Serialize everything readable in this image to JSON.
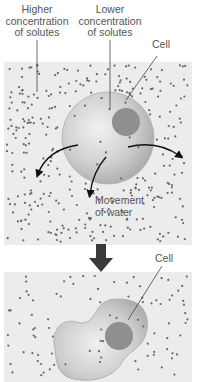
{
  "labels": {
    "higher_line1": "Higher",
    "higher_line2": "concentration",
    "higher_line3": "of solutes",
    "lower_line1": "Lower",
    "lower_line2": "concentration",
    "lower_line3": "of solutes",
    "cell_top": "Cell",
    "movement_line1": "Movement",
    "movement_line2": "of water",
    "cell_bottom": "Cell"
  },
  "colors": {
    "background_panel": "#ececec",
    "solute_dot": "#666666",
    "cell_fill": "#c8c8c8",
    "nucleus": "#8f8f8f",
    "arrow": "#3a3a3a",
    "text": "#555555"
  },
  "stages": [
    {
      "name": "before",
      "description": "Cell in hypertonic solution, water moves out"
    },
    {
      "name": "after",
      "description": "Shrunken cell"
    }
  ]
}
